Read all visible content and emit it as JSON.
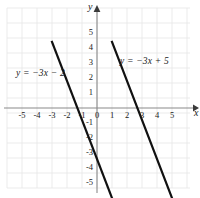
{
  "chart_data": {
    "type": "line",
    "title": "",
    "xlabel": "x",
    "ylabel": "y",
    "xlim": [
      -5.9,
      6.1
    ],
    "ylim": [
      -6.4,
      5.9
    ],
    "grid": true,
    "grid_step": 1,
    "legend": "inline-annotations",
    "x_ticks": [
      "-5",
      "-4",
      "-3",
      "-2",
      "-1",
      "0",
      "1",
      "2",
      "3",
      "4",
      "5"
    ],
    "x_tick_values": [
      -5,
      -4,
      -3,
      -2,
      -1,
      0,
      1,
      2,
      3,
      4,
      5
    ],
    "y_ticks": [
      "5",
      "4",
      "3",
      "2",
      "1",
      "-1",
      "-2",
      "-3",
      "-4",
      "-5"
    ],
    "y_tick_values": [
      5,
      4,
      3,
      2,
      1,
      -1,
      -2,
      -3,
      -4,
      -5
    ],
    "series": [
      {
        "name": "y = -3x - 2",
        "label": "y = −3x − 2",
        "slope": -3,
        "intercept": -2,
        "x_intercept": -0.6667,
        "color": "#111111",
        "points": [
          [
            -1.4667,
            2.4
          ],
          [
            1.4667,
            -6.4
          ]
        ]
      },
      {
        "name": "y = -3x + 5",
        "label": "y = −3x + 5",
        "slope": -3,
        "intercept": 5,
        "x_intercept": 1.6667,
        "color": "#111111",
        "points": [
          [
            0.9667,
            2.1
          ],
          [
            3.8,
            -6.4
          ]
        ]
      }
    ]
  },
  "axes": {
    "x_name": "x",
    "y_name": "y",
    "axis_color": "#8a8a8a",
    "grid_color": "#e6e6e6",
    "background": "#ffffff"
  },
  "annotations": {
    "left_equation": "y = −3x − 2",
    "right_equation": "y = −3x + 5"
  }
}
